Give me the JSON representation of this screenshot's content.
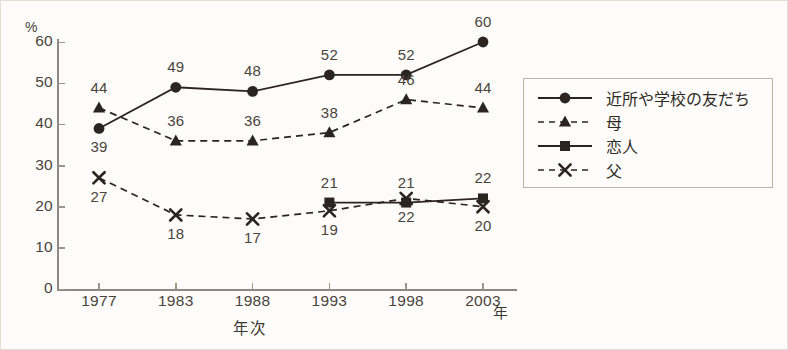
{
  "axes": {
    "y_unit": "%",
    "y_ticks": [
      0,
      10,
      20,
      30,
      40,
      50,
      60
    ],
    "x_ticks": [
      "1977",
      "1983",
      "1988",
      "1993",
      "1998",
      "2003"
    ],
    "x_title": "年次",
    "x_unit": "年"
  },
  "legend": {
    "items": [
      {
        "label": "近所や学校の友だち",
        "marker": "circle-marker",
        "line": "solid"
      },
      {
        "label": "母",
        "marker": "triangle-marker",
        "line": "dashed"
      },
      {
        "label": "恋人",
        "marker": "square-marker",
        "line": "solid"
      },
      {
        "label": "父",
        "marker": "x-marker",
        "line": "dashed"
      }
    ]
  },
  "chart_data": {
    "type": "line",
    "title": "",
    "xlabel": "年次",
    "ylabel": "%",
    "ylim": [
      0,
      60
    ],
    "grid": false,
    "legend_position": "right",
    "categories": [
      "1977",
      "1983",
      "1988",
      "1993",
      "1998",
      "2003"
    ],
    "series": [
      {
        "name": "近所や学校の友だち",
        "marker": "circle",
        "line": "solid",
        "color": "#2a2520",
        "values": [
          39,
          49,
          48,
          52,
          52,
          60
        ],
        "label_positions": [
          "below",
          "above",
          "above",
          "above",
          "above",
          "above"
        ]
      },
      {
        "name": "母",
        "marker": "triangle",
        "line": "dashed",
        "color": "#2a2520",
        "values": [
          44,
          36,
          36,
          38,
          46,
          44
        ],
        "label_positions": [
          "above",
          "above",
          "above",
          "above",
          "above",
          "above"
        ]
      },
      {
        "name": "恋人",
        "marker": "square",
        "line": "solid",
        "color": "#2a2520",
        "values": [
          null,
          null,
          null,
          21,
          21,
          22
        ],
        "label_positions": [
          null,
          null,
          null,
          "above",
          "above",
          "above"
        ]
      },
      {
        "name": "父",
        "marker": "x",
        "line": "dashed",
        "color": "#2a2520",
        "values": [
          27,
          18,
          17,
          19,
          22,
          20
        ],
        "label_positions": [
          "below",
          "below",
          "below",
          "below",
          "below",
          "below"
        ]
      }
    ]
  }
}
